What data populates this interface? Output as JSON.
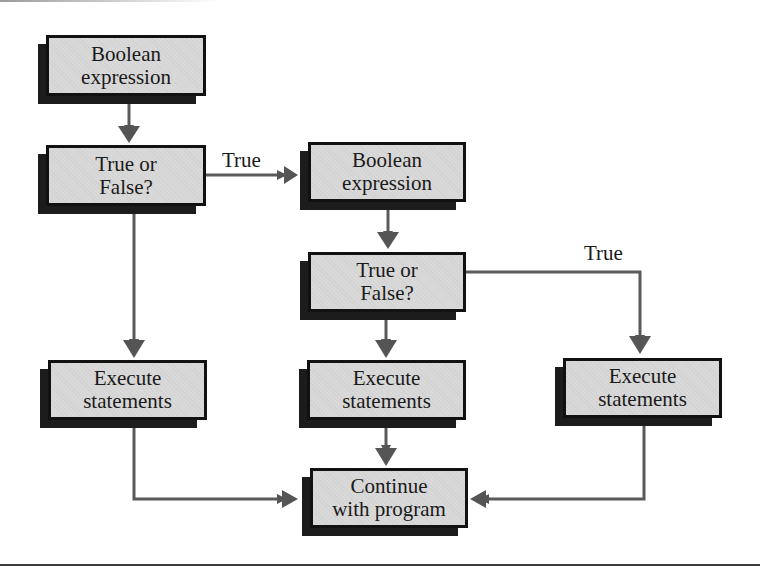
{
  "diagram": {
    "type": "flowchart",
    "nodes": {
      "boolean1": {
        "line1": "Boolean",
        "line2": "expression"
      },
      "decision1": {
        "line1": "True or",
        "line2": "False?"
      },
      "boolean2": {
        "line1": "Boolean",
        "line2": "expression"
      },
      "decision2": {
        "line1": "True or",
        "line2": "False?"
      },
      "execute_left": {
        "line1": "Execute",
        "line2": "statements"
      },
      "execute_middle": {
        "line1": "Execute",
        "line2": "statements"
      },
      "execute_right": {
        "line1": "Execute",
        "line2": "statements"
      },
      "continue": {
        "line1": "Continue",
        "line2": "with program"
      }
    },
    "edge_labels": {
      "decision1_true": "True",
      "decision2_true": "True"
    },
    "edges": [
      {
        "from": "boolean1",
        "to": "decision1",
        "label": ""
      },
      {
        "from": "decision1",
        "to": "boolean2",
        "label": "True"
      },
      {
        "from": "decision1",
        "to": "execute_left",
        "label": ""
      },
      {
        "from": "boolean2",
        "to": "decision2",
        "label": ""
      },
      {
        "from": "decision2",
        "to": "execute_right",
        "label": "True"
      },
      {
        "from": "decision2",
        "to": "execute_middle",
        "label": ""
      },
      {
        "from": "execute_left",
        "to": "continue",
        "label": ""
      },
      {
        "from": "execute_middle",
        "to": "continue",
        "label": ""
      },
      {
        "from": "execute_right",
        "to": "continue",
        "label": ""
      }
    ],
    "colors": {
      "box_fill": "#d9d9d9",
      "box_border": "#111111",
      "shadow": "#1c1c1c",
      "connector": "#555555"
    }
  }
}
